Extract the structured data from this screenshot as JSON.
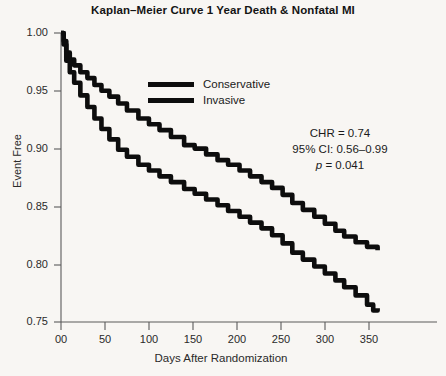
{
  "chart_data": {
    "type": "line",
    "title": "Kaplan–Meier Curve 1 Year Death & Nonfatal MI",
    "xlabel": "Days After Randomization",
    "ylabel": "Event Free",
    "xlim": [
      0,
      365
    ],
    "ylim": [
      0.75,
      1.0
    ],
    "grid": false,
    "legend_position": "upper-center",
    "xticks": [
      0,
      50,
      100,
      150,
      200,
      250,
      300,
      350
    ],
    "xtick_labels": [
      "00",
      "50",
      "100",
      "150",
      "200",
      "250",
      "300",
      "350"
    ],
    "yticks": [
      0.75,
      0.8,
      0.85,
      0.9,
      0.95,
      1.0
    ],
    "ytick_labels": [
      "0.75",
      "0.80",
      "0.85",
      "0.90",
      "0.95",
      "1.00"
    ],
    "series": [
      {
        "name": "Conservative",
        "color": "#0d0d0d",
        "step": true,
        "x": [
          0,
          3,
          6,
          10,
          15,
          22,
          30,
          38,
          46,
          55,
          65,
          75,
          88,
          100,
          112,
          125,
          140,
          152,
          165,
          178,
          190,
          203,
          215,
          228,
          240,
          252,
          263,
          275,
          288,
          300,
          312,
          322,
          335,
          348,
          360
        ],
        "y": [
          1.0,
          0.993,
          0.983,
          0.977,
          0.972,
          0.966,
          0.961,
          0.955,
          0.95,
          0.945,
          0.939,
          0.933,
          0.926,
          0.921,
          0.916,
          0.91,
          0.903,
          0.9,
          0.895,
          0.89,
          0.886,
          0.881,
          0.876,
          0.871,
          0.866,
          0.86,
          0.853,
          0.847,
          0.841,
          0.835,
          0.829,
          0.824,
          0.819,
          0.815,
          0.812
        ]
      },
      {
        "name": "Invasive",
        "color": "#0d0d0d",
        "step": true,
        "x": [
          0,
          3,
          6,
          10,
          15,
          22,
          30,
          38,
          46,
          55,
          65,
          75,
          88,
          100,
          112,
          125,
          140,
          152,
          165,
          178,
          190,
          203,
          215,
          228,
          240,
          252,
          263,
          275,
          288,
          300,
          312,
          322,
          335,
          348,
          355,
          360
        ],
        "y": [
          1.0,
          0.99,
          0.976,
          0.966,
          0.957,
          0.946,
          0.936,
          0.926,
          0.917,
          0.908,
          0.899,
          0.893,
          0.886,
          0.881,
          0.876,
          0.871,
          0.865,
          0.861,
          0.856,
          0.851,
          0.846,
          0.841,
          0.836,
          0.831,
          0.825,
          0.818,
          0.81,
          0.804,
          0.798,
          0.792,
          0.786,
          0.78,
          0.773,
          0.765,
          0.76,
          0.762
        ]
      }
    ],
    "annotations": {
      "chr": "CHR = 0.74",
      "ci": "95% CI: 0.56–0.99",
      "p_label": "p",
      "p_value": " = 0.041"
    }
  }
}
